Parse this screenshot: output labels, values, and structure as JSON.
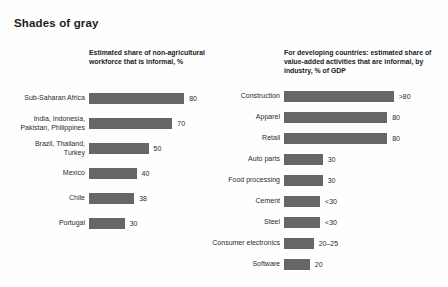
{
  "title": "Shades of gray",
  "chart_data": [
    {
      "type": "bar",
      "orientation": "horizontal",
      "title": "Estimated share of non-agricultural workforce that is informal, %",
      "xlabel": "",
      "ylabel": "",
      "xlim": [
        0,
        80
      ],
      "grid": false,
      "legend": "none",
      "bar_color": "#666666",
      "categories": [
        "Sub-Saharan Africa",
        "India, Indonesia,\nPakistan, Philippines",
        "Brazil, Thailand,\nTurkey",
        "Mexico",
        "Chile",
        "Portugal"
      ],
      "values": [
        80,
        70,
        50,
        40,
        38,
        30
      ],
      "value_labels": [
        "80",
        "70",
        "50",
        "40",
        "38",
        "30"
      ]
    },
    {
      "type": "bar",
      "orientation": "horizontal",
      "title": "For developing countries: estimated share of value-added activities that are informal, by industry, % of GDP",
      "xlabel": "",
      "ylabel": "",
      "xlim": [
        0,
        90
      ],
      "grid": false,
      "legend": "none",
      "bar_color": "#666666",
      "categories": [
        "Construction",
        "Apparel",
        "Retail",
        "Auto parts",
        "Food processing",
        "Cement",
        "Steel",
        "Consumer electronics",
        "Software"
      ],
      "values": [
        85,
        80,
        80,
        30,
        30,
        28,
        28,
        23,
        20
      ],
      "value_labels": [
        ">80",
        "80",
        "80",
        "30",
        "30",
        "<30",
        "<30",
        "20–25",
        "20"
      ]
    }
  ]
}
